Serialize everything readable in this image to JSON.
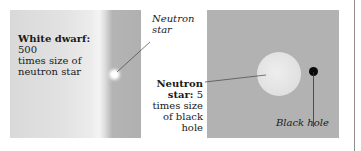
{
  "figure": {
    "left_panel": {
      "white_dwarf_label_bold": "White dwarf:",
      "white_dwarf_label_rest": " 500",
      "white_dwarf_line2": "times size of",
      "white_dwarf_line3": "neutron star",
      "neutron_star_callout_line1": "Neutron",
      "neutron_star_callout_line2": "star"
    },
    "right_panel": {
      "neutron_label_bold_1": "Neutron",
      "neutron_label_bold_2": "star:",
      "neutron_label_rest_2": " 5",
      "neutron_label_line3": "times size",
      "neutron_label_line4": "of black",
      "neutron_label_line5": "hole",
      "black_hole_label": "Black hole"
    },
    "colors": {
      "panel_gray": "#b2b2b2",
      "white_dwarf_light": "#ececec",
      "black_hole": "#0a0a0a",
      "neutron_star": "#e2e2e2"
    }
  }
}
